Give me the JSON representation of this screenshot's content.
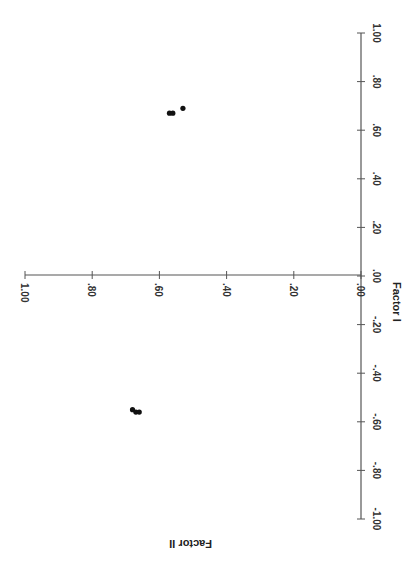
{
  "chart_data": {
    "type": "scatter",
    "title": "",
    "orientation_note": "figure rotated 90 degrees clockwise on page",
    "xlabel": "Factor I",
    "ylabel": "Factor II",
    "x_axis": {
      "label": "Factor I",
      "range": [
        -1.0,
        1.0
      ],
      "ticks": [
        1.0,
        0.8,
        0.6,
        0.4,
        0.2,
        0.0,
        -0.2,
        -0.4,
        -0.6,
        -0.8,
        -1.0
      ],
      "tick_labels": [
        "1.00",
        ".80",
        ".60",
        ".40",
        ".20",
        ".00",
        "-.20",
        "-.40",
        "-.60",
        "-.80",
        "-1.00"
      ]
    },
    "y_axis": {
      "label": "Factor II",
      "range": [
        0.0,
        1.0
      ],
      "ticks": [
        1.0,
        0.8,
        0.6,
        0.4,
        0.2,
        0.0
      ],
      "tick_labels": [
        "1.00",
        ".80",
        ".60",
        ".40",
        ".20",
        ".00"
      ]
    },
    "grid": false,
    "legend": null,
    "series": [
      {
        "name": "loadings",
        "points": [
          {
            "factor_I": 0.67,
            "factor_II": 0.57
          },
          {
            "factor_I": 0.67,
            "factor_II": 0.56
          },
          {
            "factor_I": 0.69,
            "factor_II": 0.53
          },
          {
            "factor_I": -0.55,
            "factor_II": 0.68
          },
          {
            "factor_I": -0.56,
            "factor_II": 0.67
          },
          {
            "factor_I": -0.56,
            "factor_II": 0.66
          }
        ]
      }
    ]
  },
  "colors": {
    "axis": "#555555",
    "points": "#111111",
    "background": "#ffffff"
  }
}
